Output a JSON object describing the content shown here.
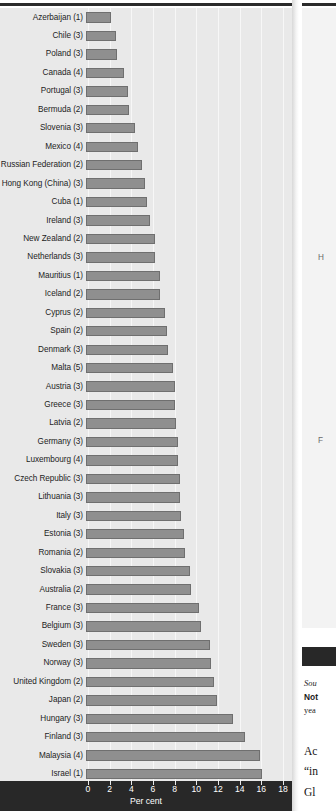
{
  "chart_data": {
    "type": "bar",
    "orientation": "horizontal",
    "title": "",
    "xlabel": "Per cent",
    "ylabel": "",
    "xlim": [
      0,
      18
    ],
    "xticks": [
      0,
      2,
      4,
      6,
      8,
      10,
      12,
      14,
      16,
      18
    ],
    "grid": true,
    "legend": "none",
    "bar_color": "#8f8f8f",
    "categories": [
      "Azerbaijan (1)",
      "Chile (3)",
      "Poland (3)",
      "Canada (4)",
      "Portugal (3)",
      "Bermuda (2)",
      "Slovenia (3)",
      "Mexico (4)",
      "Russian Federation (2)",
      "Hong Kong (China) (3)",
      "Cuba (1)",
      "Ireland (3)",
      "New Zealand (2)",
      "Netherlands (3)",
      "Mauritius (1)",
      "Iceland (2)",
      "Cyprus (2)",
      "Spain (2)",
      "Denmark (3)",
      "Malta (5)",
      "Austria (3)",
      "Greece (3)",
      "Latvia (2)",
      "Germany (3)",
      "Luxembourg (4)",
      "Czech Republic (3)",
      "Lithuania (3)",
      "Italy (3)",
      "Estonia (3)",
      "Romania (2)",
      "Slovakia (3)",
      "Australia (2)",
      "France (3)",
      "Belgium (3)",
      "Sweden (3)",
      "Norway (3)",
      "United Kingdom (2)",
      "Japan (2)",
      "Hungary (3)",
      "Finland (3)",
      "Malaysia (4)",
      "Israel (1)"
    ],
    "values": [
      2.3,
      2.8,
      2.9,
      3.5,
      3.9,
      4.0,
      4.5,
      4.8,
      5.2,
      5.4,
      5.6,
      5.9,
      6.4,
      6.4,
      6.8,
      6.8,
      7.3,
      7.5,
      7.6,
      8.0,
      8.2,
      8.2,
      8.3,
      8.5,
      8.5,
      8.7,
      8.7,
      8.8,
      9.0,
      9.1,
      9.6,
      9.7,
      10.4,
      10.6,
      11.4,
      11.5,
      11.8,
      12.1,
      13.6,
      14.7,
      16.1,
      16.2
    ]
  },
  "axis": {
    "title": "Per cent",
    "tick_labels": [
      "0",
      "2",
      "4",
      "6",
      "8",
      "10",
      "12",
      "14",
      "16",
      "18"
    ]
  },
  "right_column": {
    "chart_label_fragments": [
      "H",
      "F"
    ],
    "source_fragment": "Sou",
    "note_fragment": "Not",
    "note_line2_fragment": "yea",
    "body_fragments": [
      "Ac",
      "“in",
      "Gl"
    ]
  }
}
